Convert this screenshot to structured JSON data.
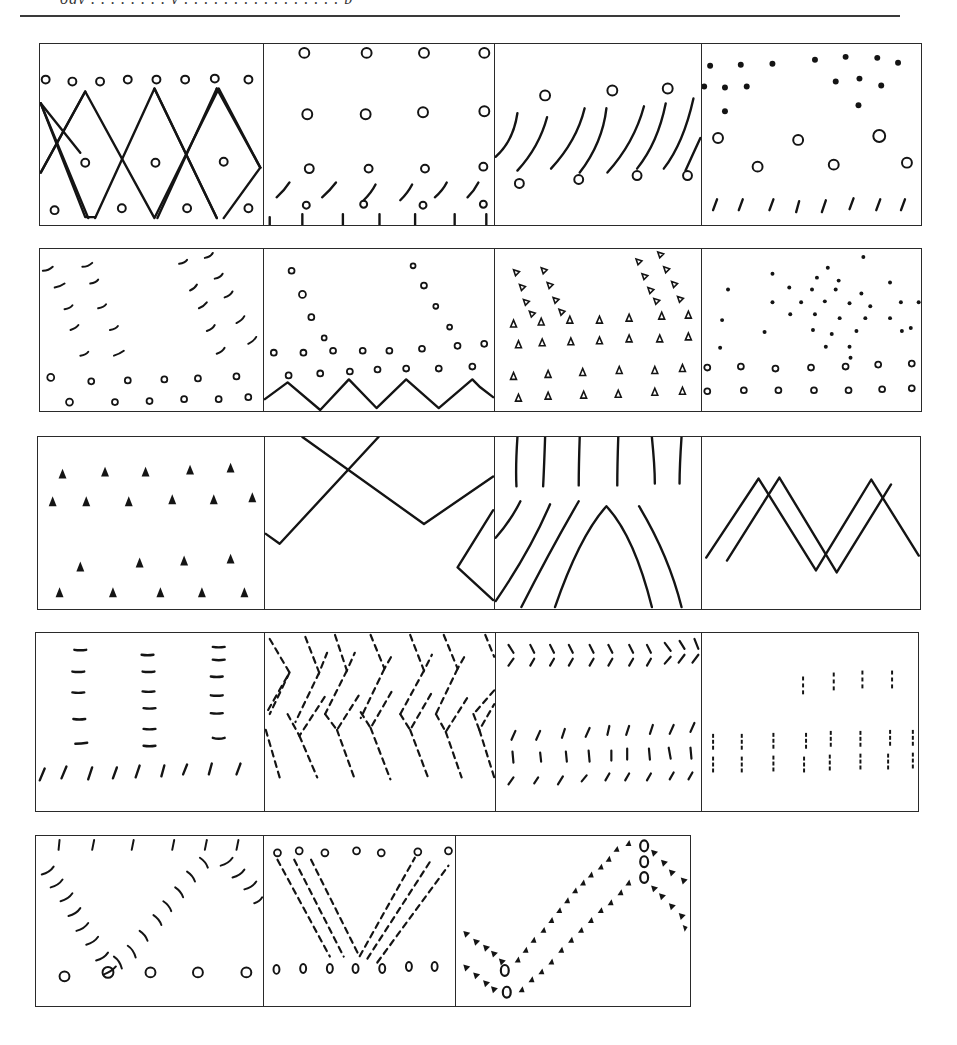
{
  "page": {
    "header_text": "ogy . . . . . . . . y . . . . . . . . . . . . . . . . p"
  },
  "rows": [
    {
      "id": 1,
      "panels": [
        {
          "id": "1a",
          "label": "Zigzag lattice with circles"
        },
        {
          "id": "1b",
          "label": "Circles grid with curved ticks"
        },
        {
          "id": "1c",
          "label": "Diagonal curved strokes with circles"
        },
        {
          "id": "1d",
          "label": "Dots, circles and slash ticks"
        }
      ]
    },
    {
      "id": 2,
      "panels": [
        {
          "id": "2a",
          "label": "Curved arcs V-shape with small circles"
        },
        {
          "id": "2b",
          "label": "Circle V-pattern over zigzag"
        },
        {
          "id": "2c",
          "label": "Triangle marks fan pattern"
        },
        {
          "id": "2d",
          "label": "Dot diamond cluster over circle rows"
        }
      ]
    },
    {
      "id": 3,
      "panels": [
        {
          "id": "3a",
          "label": "Filled triangle rows"
        },
        {
          "id": "3b",
          "label": "Crossing zigzag lines"
        },
        {
          "id": "3c",
          "label": "Vertical strokes over arching curves"
        },
        {
          "id": "3d",
          "label": "Double offset zigzag"
        }
      ]
    },
    {
      "id": 4,
      "panels": [
        {
          "id": "4a",
          "label": "Columns of dashes over slash ticks"
        },
        {
          "id": "4b",
          "label": "Dashed chevron herringbone"
        },
        {
          "id": "4c",
          "label": "Chevron ticks and slash rows"
        },
        {
          "id": "4d",
          "label": "Dotted vertical dash clusters"
        }
      ]
    },
    {
      "id": 5,
      "panels": [
        {
          "id": "5a",
          "label": "Arc V-curve with circles"
        },
        {
          "id": "5b",
          "label": "Dashed V with circle rows"
        },
        {
          "id": "5c",
          "label": "Wavy triangle-dot bands with zeros"
        }
      ]
    }
  ]
}
